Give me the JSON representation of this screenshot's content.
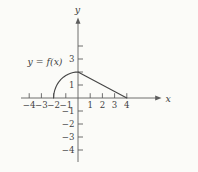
{
  "chart_data": {
    "type": "line",
    "title": "",
    "annotation": "y = f(x)",
    "xlabel": "x",
    "ylabel": "y",
    "xlim": [
      -4.7,
      4.9
    ],
    "ylim": [
      -5.0,
      4.7
    ],
    "grid": false,
    "x_ticks": [
      -4,
      -3,
      -2,
      -1,
      1,
      2,
      3,
      4
    ],
    "x_tick_labels": [
      "−4",
      "−3",
      "−2",
      "−1",
      "1",
      "2",
      "3",
      "4"
    ],
    "y_ticks": [
      -4,
      -3,
      -2,
      -1,
      1,
      2,
      3,
      4
    ],
    "y_tick_labels": [
      "−4",
      "−3",
      "−2",
      "−1",
      "1",
      "",
      "3",
      ""
    ],
    "series": [
      {
        "name": "f",
        "segments": [
          {
            "shape": "quarter-circle-arc",
            "equation": "y = sqrt(4 - x^2), -2 <= x <= 0",
            "points": [
              [
                -2,
                0
              ],
              [
                -1.98,
                0.28
              ],
              [
                -1.95,
                0.44
              ],
              [
                -1.9,
                0.62
              ],
              [
                -1.8,
                0.87
              ],
              [
                -1.7,
                1.05
              ],
              [
                -1.6,
                1.2
              ],
              [
                -1.4,
                1.43
              ],
              [
                -1.2,
                1.6
              ],
              [
                -1.0,
                1.73
              ],
              [
                -0.8,
                1.83
              ],
              [
                -0.6,
                1.91
              ],
              [
                -0.4,
                1.96
              ],
              [
                -0.2,
                1.99
              ],
              [
                0,
                2
              ]
            ]
          },
          {
            "shape": "line-segment",
            "equation": "y = 2 - x/2, 0 <= x <= 4",
            "points": [
              [
                0,
                2
              ],
              [
                1,
                1.5
              ],
              [
                2,
                1
              ],
              [
                3,
                0.5
              ],
              [
                4,
                0
              ]
            ]
          }
        ]
      }
    ],
    "colors": {
      "axis": "#5d5d5d",
      "curve": "#454545",
      "text": "#3f3f3f"
    }
  }
}
